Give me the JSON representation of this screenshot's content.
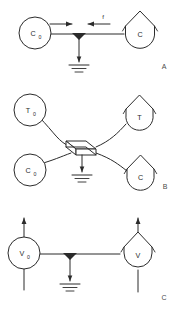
{
  "figure": {
    "title": "",
    "background_color": "#ffffff",
    "line_color": "#2b2b2b",
    "width": 187,
    "height": 316,
    "panels": [
      {
        "id": "panel-a",
        "label": "A",
        "description": "Source circle C0 connected by a horizontal line through a grounded junction to a capacity node C; arrows indicate flux f.",
        "nodes": [
          {
            "id": "a-c0",
            "shape": "circle",
            "label": "C",
            "subscript": "0"
          },
          {
            "id": "a-c",
            "shape": "house",
            "label": "C",
            "subscript": ""
          }
        ],
        "flux_labels": [
          {
            "id": "a-flux-f",
            "text": "f"
          }
        ],
        "ground": {
          "id": "a-ground",
          "name": "ground-symbol"
        },
        "arrows": [
          {
            "id": "a-arrow-right",
            "direction": "right"
          },
          {
            "id": "a-arrow-left",
            "direction": "left"
          },
          {
            "id": "a-arrow-down",
            "direction": "down"
          }
        ]
      },
      {
        "id": "panel-b",
        "label": "B",
        "description": "Two source circles T0 and C0 at left connected by curved lines to a central parallelepiped element, which connects to capacity nodes T and C at right; the element is grounded.",
        "nodes": [
          {
            "id": "b-t0",
            "shape": "circle",
            "label": "T",
            "subscript": "0"
          },
          {
            "id": "b-c0",
            "shape": "circle",
            "label": "C",
            "subscript": "0"
          },
          {
            "id": "b-t",
            "shape": "house",
            "label": "T",
            "subscript": ""
          },
          {
            "id": "b-c",
            "shape": "house",
            "label": "C",
            "subscript": ""
          }
        ],
        "flux_labels": [],
        "center_element": {
          "id": "b-slab",
          "name": "parallelepiped-element"
        },
        "ground": {
          "id": "b-ground",
          "name": "ground-symbol"
        },
        "arrows": [
          {
            "id": "b-arrow-down",
            "direction": "down"
          }
        ]
      },
      {
        "id": "panel-c",
        "label": "C",
        "description": "Source circle V0 and capacity node V, each with a vertical through-line ending in an upward arrow, joined by a horizontal line through a grounded junction.",
        "nodes": [
          {
            "id": "c-v0",
            "shape": "circle",
            "label": "V",
            "subscript": "0"
          },
          {
            "id": "c-v",
            "shape": "house",
            "label": "V",
            "subscript": ""
          }
        ],
        "flux_labels": [],
        "ground": {
          "id": "c-ground",
          "name": "ground-symbol"
        },
        "arrows": [
          {
            "id": "c-arrow-up-left",
            "direction": "up"
          },
          {
            "id": "c-arrow-up-right",
            "direction": "up"
          },
          {
            "id": "c-arrow-down",
            "direction": "down"
          }
        ]
      }
    ]
  }
}
